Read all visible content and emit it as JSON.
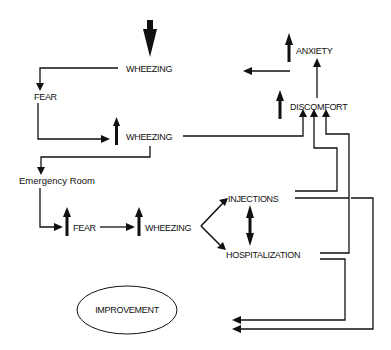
{
  "diagram": {
    "type": "flowchart",
    "nodes": {
      "wheezing_1": {
        "label": "WHEEZING",
        "indicator": "decrease"
      },
      "fear_1": {
        "label": "FEAR",
        "indicator": "none"
      },
      "wheezing_2": {
        "label": "WHEEZING",
        "indicator": "increase"
      },
      "emergency_room": {
        "label": "Emergency Room",
        "indicator": "none"
      },
      "fear_2": {
        "label": "FEAR",
        "indicator": "increase"
      },
      "wheezing_3": {
        "label": "WHEEZING",
        "indicator": "increase"
      },
      "injections": {
        "label": "INJECTIONS",
        "indicator": "none"
      },
      "hospitalization": {
        "label": "HOSPITALIZATION",
        "indicator": "none"
      },
      "discomfort": {
        "label": "DISCOMFORT",
        "indicator": "increase"
      },
      "anxiety": {
        "label": "ANXIETY",
        "indicator": "increase"
      },
      "improvement": {
        "label": "IMPROVEMENT",
        "indicator": "none",
        "shape": "ellipse"
      }
    },
    "edges": [
      {
        "from": "wheezing_1",
        "to": "fear_1"
      },
      {
        "from": "fear_1",
        "to": "wheezing_2"
      },
      {
        "from": "wheezing_2",
        "to": "emergency_room"
      },
      {
        "from": "wheezing_2",
        "to": "discomfort"
      },
      {
        "from": "emergency_room",
        "to": "fear_2"
      },
      {
        "from": "fear_2",
        "to": "wheezing_3"
      },
      {
        "from": "wheezing_3",
        "to": "injections"
      },
      {
        "from": "wheezing_3",
        "to": "hospitalization"
      },
      {
        "from": "injections",
        "to": "hospitalization",
        "bidirectional": true
      },
      {
        "from": "injections",
        "to": "discomfort"
      },
      {
        "from": "hospitalization",
        "to": "discomfort"
      },
      {
        "from": "discomfort",
        "to": "anxiety"
      },
      {
        "from": "anxiety",
        "to": "wheezing_1"
      },
      {
        "from": "injections",
        "to": "improvement"
      },
      {
        "from": "hospitalization",
        "to": "improvement"
      }
    ]
  }
}
